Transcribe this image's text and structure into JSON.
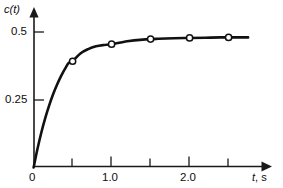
{
  "chart_data": {
    "type": "line",
    "title": "",
    "xlabel": "t, s",
    "ylabel": "c(t)",
    "xlim": [
      0,
      3.05
    ],
    "ylim": [
      0,
      0.575
    ],
    "grid": false,
    "legend": "none",
    "x_ticks_major": [
      0,
      1.0,
      2.0
    ],
    "x_tick_labels_major": [
      "0",
      "1.0",
      "2.0"
    ],
    "x_ticks_minor": [
      0.5,
      1.5,
      2.5
    ],
    "y_ticks_major": [
      0.25,
      0.5
    ],
    "y_tick_labels_major": [
      "0.25",
      "0.5"
    ],
    "annotations": [],
    "series": [
      {
        "name": "c(t)",
        "marker": "open-circle",
        "line_style": "solid",
        "color": "#111111",
        "marker_x": [
          0.5,
          1.0,
          1.5,
          2.0,
          2.5
        ],
        "marker_y": [
          0.392,
          0.455,
          0.474,
          0.478,
          0.48
        ],
        "curve_x": [
          0.0,
          0.05,
          0.1,
          0.15,
          0.2,
          0.25,
          0.3,
          0.35,
          0.4,
          0.45,
          0.5,
          0.6,
          0.7,
          0.8,
          0.9,
          1.0,
          1.2,
          1.4,
          1.6,
          1.8,
          2.0,
          2.2,
          2.4,
          2.6,
          2.75
        ],
        "curve_y": [
          0.0,
          0.069,
          0.13,
          0.183,
          0.229,
          0.27,
          0.305,
          0.336,
          0.363,
          0.386,
          0.392,
          0.421,
          0.437,
          0.447,
          0.452,
          0.455,
          0.466,
          0.472,
          0.475,
          0.477,
          0.478,
          0.479,
          0.48,
          0.48,
          0.48
        ]
      }
    ]
  },
  "axes": {
    "y_title_text": "c(t)",
    "y_title_var": "c",
    "y_title_arg": "(t)",
    "x_title_var": "t",
    "x_title_unit": ", s",
    "x_title_full": "t, s"
  },
  "ticks": {
    "y_05": "0.5",
    "y_025": "0.25",
    "x_0": "0",
    "x_10": "1.0",
    "x_20": "2.0"
  },
  "colors": {
    "curve": "#111111",
    "axis": "#1a1a1a",
    "marker_fill": "#ffffff",
    "background": "#ffffff",
    "text": "#0d0d0d"
  }
}
